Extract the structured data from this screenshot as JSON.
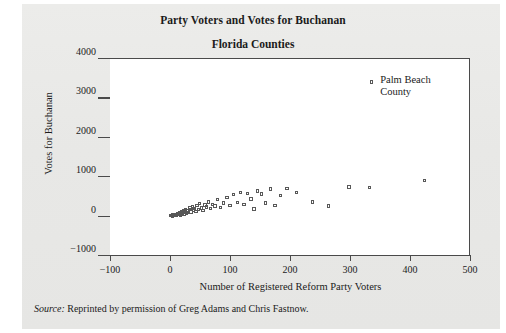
{
  "figure": {
    "source_prefix": "Source:",
    "source_text": " Reprinted by permission of Greg Adams and Chris Fastnow.",
    "annotation_label": "Palm Beach\nCounty"
  },
  "chart_data": {
    "type": "scatter",
    "title": "Party Voters and Votes for Buchanan",
    "subtitle": "Florida Counties",
    "xlabel": "Number of Registered Reform Party Voters",
    "ylabel": "Votes for Buchanan",
    "xlim": [
      -100,
      500
    ],
    "ylim": [
      -1000,
      4000
    ],
    "xticks": [
      -100,
      0,
      100,
      200,
      300,
      400,
      500
    ],
    "xtick_labels": [
      "−100",
      "0",
      "100",
      "200",
      "300",
      "400",
      "500"
    ],
    "yticks": [
      -1000,
      0,
      1000,
      2000,
      3000,
      4000
    ],
    "ytick_labels": [
      "−1000",
      "0",
      "1000",
      "2000",
      "3000",
      "4000"
    ],
    "grid": false,
    "legend": false,
    "marker": "open-square",
    "marker_color": "#585858",
    "annotations": [
      {
        "label": "Palm Beach County",
        "x": 337,
        "y": 3407
      }
    ],
    "points": [
      {
        "x": 2,
        "y": 9
      },
      {
        "x": 3,
        "y": 13
      },
      {
        "x": 4,
        "y": 22
      },
      {
        "x": 5,
        "y": 5
      },
      {
        "x": 6,
        "y": 29
      },
      {
        "x": 7,
        "y": 17
      },
      {
        "x": 8,
        "y": 26
      },
      {
        "x": 9,
        "y": 11
      },
      {
        "x": 10,
        "y": 35
      },
      {
        "x": 11,
        "y": 45
      },
      {
        "x": 12,
        "y": 19
      },
      {
        "x": 13,
        "y": 55
      },
      {
        "x": 14,
        "y": 33
      },
      {
        "x": 15,
        "y": 70
      },
      {
        "x": 16,
        "y": 41
      },
      {
        "x": 17,
        "y": 90
      },
      {
        "x": 18,
        "y": 25
      },
      {
        "x": 19,
        "y": 62
      },
      {
        "x": 20,
        "y": 120
      },
      {
        "x": 21,
        "y": 48
      },
      {
        "x": 22,
        "y": 78
      },
      {
        "x": 24,
        "y": 145
      },
      {
        "x": 25,
        "y": 58
      },
      {
        "x": 26,
        "y": 100
      },
      {
        "x": 27,
        "y": 175
      },
      {
        "x": 28,
        "y": 66
      },
      {
        "x": 29,
        "y": 132
      },
      {
        "x": 31,
        "y": 88
      },
      {
        "x": 33,
        "y": 160
      },
      {
        "x": 34,
        "y": 210
      },
      {
        "x": 36,
        "y": 105
      },
      {
        "x": 38,
        "y": 240
      },
      {
        "x": 40,
        "y": 150
      },
      {
        "x": 42,
        "y": 195
      },
      {
        "x": 44,
        "y": 118
      },
      {
        "x": 46,
        "y": 265
      },
      {
        "x": 48,
        "y": 170
      },
      {
        "x": 50,
        "y": 320
      },
      {
        "x": 53,
        "y": 205
      },
      {
        "x": 56,
        "y": 142
      },
      {
        "x": 59,
        "y": 285
      },
      {
        "x": 62,
        "y": 230
      },
      {
        "x": 65,
        "y": 360
      },
      {
        "x": 68,
        "y": 188
      },
      {
        "x": 72,
        "y": 300
      },
      {
        "x": 76,
        "y": 255
      },
      {
        "x": 80,
        "y": 420
      },
      {
        "x": 85,
        "y": 212
      },
      {
        "x": 90,
        "y": 330
      },
      {
        "x": 96,
        "y": 470
      },
      {
        "x": 101,
        "y": 268
      },
      {
        "x": 107,
        "y": 545
      },
      {
        "x": 113,
        "y": 352
      },
      {
        "x": 118,
        "y": 600
      },
      {
        "x": 124,
        "y": 300
      },
      {
        "x": 130,
        "y": 575
      },
      {
        "x": 136,
        "y": 430
      },
      {
        "x": 141,
        "y": 185
      },
      {
        "x": 147,
        "y": 640
      },
      {
        "x": 153,
        "y": 560
      },
      {
        "x": 160,
        "y": 330
      },
      {
        "x": 168,
        "y": 690
      },
      {
        "x": 176,
        "y": 265
      },
      {
        "x": 185,
        "y": 520
      },
      {
        "x": 196,
        "y": 700
      },
      {
        "x": 212,
        "y": 600
      },
      {
        "x": 238,
        "y": 360
      },
      {
        "x": 265,
        "y": 260
      },
      {
        "x": 299,
        "y": 740
      },
      {
        "x": 333,
        "y": 720
      },
      {
        "x": 425,
        "y": 900
      },
      {
        "x": 337,
        "y": 3407
      }
    ]
  }
}
